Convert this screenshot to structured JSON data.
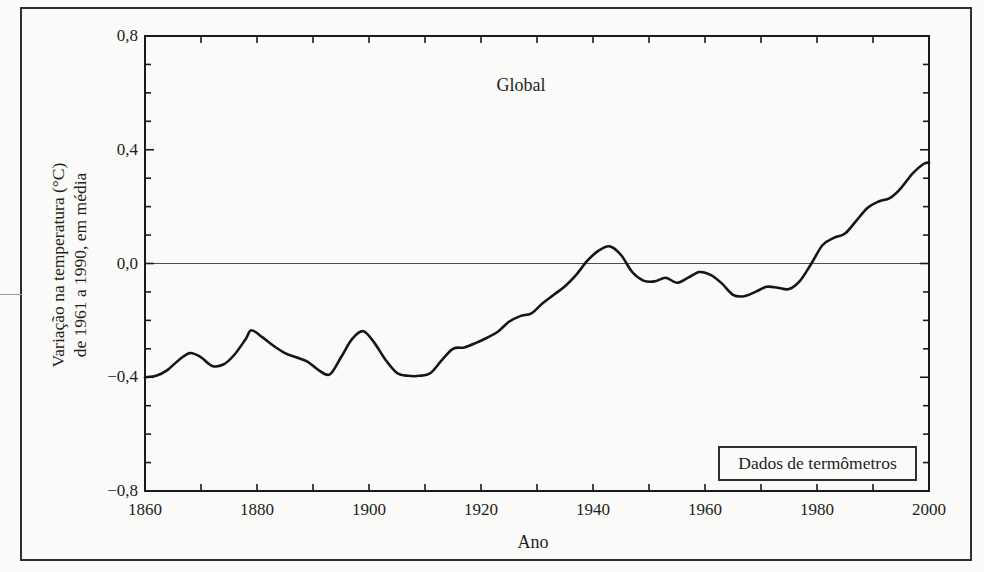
{
  "figure": {
    "background_color": "#fafaf8",
    "frame_color": "#2e2e2e",
    "line_color": "#161616"
  },
  "chart_data": {
    "type": "line",
    "annotation": "Global",
    "xlabel": "Ano",
    "ylabel_line1": "Variação na temperatura (°C)",
    "ylabel_line2": "de 1961 a 1990, em média",
    "legend_box_label": "Dados de termômetros",
    "xlim": [
      1860,
      2000
    ],
    "ylim": [
      -0.8,
      0.8
    ],
    "x_minor_step": 10,
    "y_minor_step": 0.1,
    "grid": false,
    "legend_position": "bottom-right-box",
    "x_ticks": [
      {
        "value": 1860,
        "label": "1860"
      },
      {
        "value": 1880,
        "label": "1880"
      },
      {
        "value": 1900,
        "label": "1900"
      },
      {
        "value": 1920,
        "label": "1920"
      },
      {
        "value": 1940,
        "label": "1940"
      },
      {
        "value": 1960,
        "label": "1960"
      },
      {
        "value": 1980,
        "label": "1980"
      },
      {
        "value": 2000,
        "label": "2000"
      }
    ],
    "y_ticks": [
      {
        "value": 0.8,
        "label": "0,8"
      },
      {
        "value": 0.4,
        "label": "0,4"
      },
      {
        "value": 0.0,
        "label": "0,0"
      },
      {
        "value": -0.4,
        "label": "−0,4"
      },
      {
        "value": -0.8,
        "label": "−0,8"
      }
    ],
    "series": [
      {
        "name": "Global",
        "x": [
          1860,
          1862,
          1864,
          1866,
          1868,
          1870,
          1872,
          1874,
          1876,
          1878,
          1879,
          1881,
          1883,
          1885,
          1887,
          1889,
          1891,
          1893,
          1895,
          1897,
          1899,
          1901,
          1903,
          1905,
          1907,
          1909,
          1911,
          1913,
          1915,
          1917,
          1919,
          1921,
          1923,
          1925,
          1927,
          1929,
          1931,
          1933,
          1935,
          1937,
          1939,
          1941,
          1943,
          1945,
          1947,
          1949,
          1951,
          1953,
          1955,
          1957,
          1959,
          1961,
          1963,
          1965,
          1967,
          1969,
          1971,
          1973,
          1975,
          1977,
          1979,
          1981,
          1983,
          1985,
          1987,
          1989,
          1991,
          1993,
          1995,
          1997,
          1999,
          2000
        ],
        "y": [
          -0.4,
          -0.395,
          -0.375,
          -0.34,
          -0.315,
          -0.33,
          -0.36,
          -0.355,
          -0.32,
          -0.265,
          -0.235,
          -0.26,
          -0.29,
          -0.315,
          -0.33,
          -0.345,
          -0.375,
          -0.39,
          -0.33,
          -0.265,
          -0.238,
          -0.28,
          -0.34,
          -0.385,
          -0.395,
          -0.395,
          -0.385,
          -0.34,
          -0.3,
          -0.295,
          -0.28,
          -0.262,
          -0.24,
          -0.205,
          -0.185,
          -0.175,
          -0.14,
          -0.11,
          -0.08,
          -0.04,
          0.01,
          0.045,
          0.06,
          0.03,
          -0.03,
          -0.06,
          -0.063,
          -0.05,
          -0.068,
          -0.05,
          -0.03,
          -0.04,
          -0.07,
          -0.11,
          -0.115,
          -0.1,
          -0.082,
          -0.085,
          -0.09,
          -0.06,
          0.0,
          0.065,
          0.09,
          0.105,
          0.15,
          0.195,
          0.218,
          0.23,
          0.265,
          0.315,
          0.35,
          0.355
        ]
      }
    ]
  }
}
